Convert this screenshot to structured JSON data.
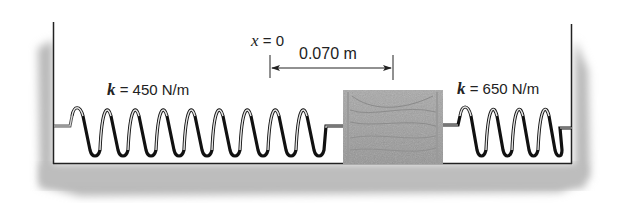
{
  "diagram": {
    "type": "spring-block system",
    "origin_label": {
      "variable": "x",
      "equals": " = 0"
    },
    "displacement": {
      "value": "0.070 m"
    },
    "left_spring": {
      "variable": "k",
      "equals": " = 450 N/m",
      "coils": 9
    },
    "right_spring": {
      "variable": "k",
      "equals": " = 650 N/m",
      "coils": 5
    },
    "block": {
      "material": "wood"
    }
  }
}
